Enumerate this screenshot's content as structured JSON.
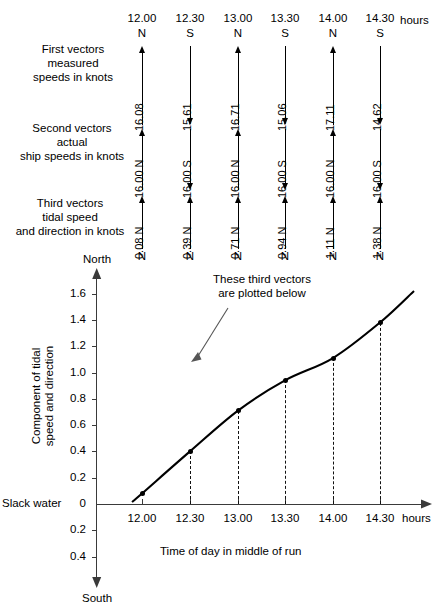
{
  "vector_table": {
    "time_unit_suffix": "hours",
    "columns": [
      {
        "time": "12.00",
        "first_dir": "N",
        "first_speed": "16.08",
        "second": "16.00 N",
        "second_dir": "N",
        "third": "0.08 N",
        "third_dir": "N"
      },
      {
        "time": "12.30",
        "first_dir": "S",
        "first_speed": "15.61",
        "second": "16.00 S",
        "second_dir": "S",
        "third": "0.39 N",
        "third_dir": "N"
      },
      {
        "time": "13.00",
        "first_dir": "N",
        "first_speed": "16.71",
        "second": "16.00 N",
        "second_dir": "N",
        "third": "0.71 N",
        "third_dir": "N"
      },
      {
        "time": "13.30",
        "first_dir": "S",
        "first_speed": "15.06",
        "second": "16.00 S",
        "second_dir": "S",
        "third": "0.94 N",
        "third_dir": "N"
      },
      {
        "time": "14.00",
        "first_dir": "N",
        "first_speed": "17.11",
        "second": "16.00 N",
        "second_dir": "N",
        "third": "1.11 N",
        "third_dir": "N"
      },
      {
        "time": "14.30",
        "first_dir": "S",
        "first_speed": "14.62",
        "second": "16.00 S",
        "second_dir": "S",
        "third": "1.38 N",
        "third_dir": "N"
      }
    ],
    "row_labels": {
      "first": "First vectors\nmeasured\nspeeds in knots",
      "first_l1": "First vectors",
      "first_l2": "measured",
      "first_l3": "speeds in knots",
      "second_l1": "Second vectors",
      "second_l2": "actual",
      "second_l3": "ship speeds in knots",
      "third_l1": "Third vectors",
      "third_l2": "tidal speed",
      "third_l3": "and direction in knots"
    }
  },
  "chart_data": {
    "type": "line",
    "title": "",
    "xlabel": "Time of day in middle of run",
    "ylabel": "Component of tidal speed and direction",
    "ylabel_line1": "Component of tidal",
    "ylabel_line2": "speed and direction",
    "x_axis_suffix": "hours",
    "categories": [
      "12.00",
      "12.30",
      "13.00",
      "13.30",
      "14.00",
      "14.30"
    ],
    "values": [
      0.08,
      0.4,
      0.71,
      0.94,
      1.11,
      1.38
    ],
    "ylim": [
      -0.5,
      1.75
    ],
    "yticks_positive": [
      "1.6",
      "1.4",
      "1.2",
      "1.0",
      "0.8",
      "0.6",
      "0.4",
      "0.2"
    ],
    "ytick_zero": "0",
    "yticks_negative": [
      "0.2",
      "0.4"
    ],
    "axis_top_label": "North",
    "axis_bottom_label": "South",
    "zero_label": "Slack water",
    "grid": false,
    "legend": "none",
    "annotation": {
      "line1": "These third vectors",
      "line2": "are plotted below",
      "points_to": "13.30"
    }
  }
}
